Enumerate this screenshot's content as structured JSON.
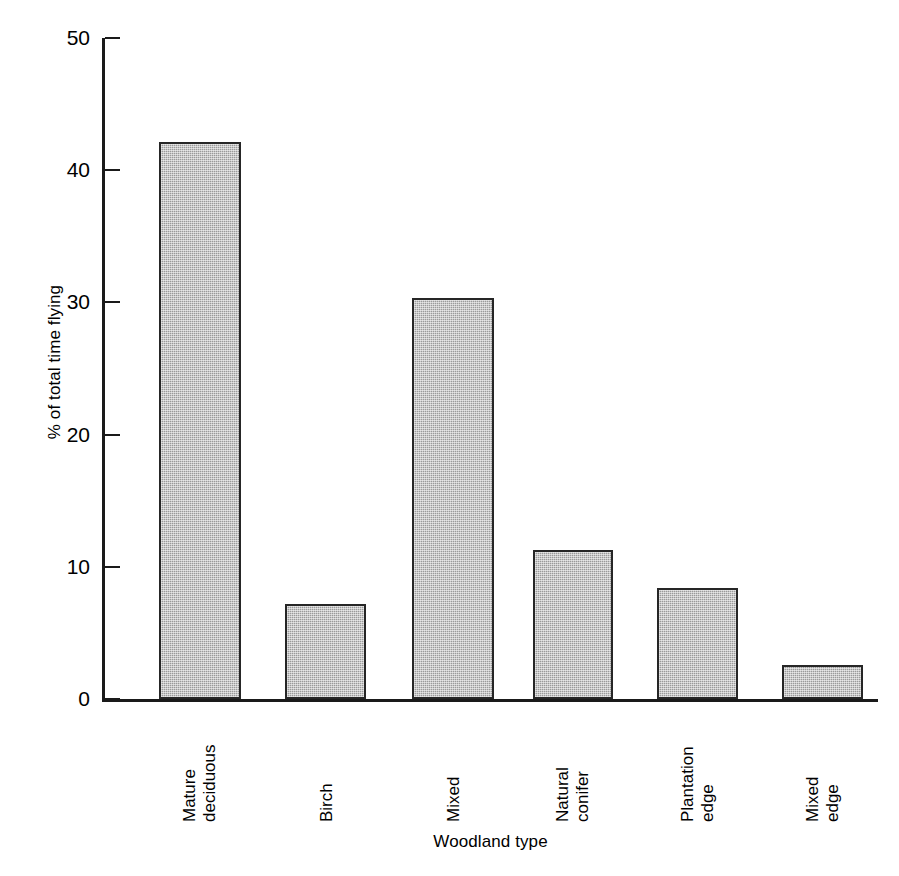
{
  "chart_data": {
    "type": "bar",
    "title": "",
    "xlabel": "Woodland type",
    "ylabel": "% of total time flying",
    "categories": [
      "Mature deciduous",
      "Birch",
      "Mixed",
      "Natural conifer",
      "Plantation edge",
      "Mixed edge"
    ],
    "category_lines": [
      [
        "Mature",
        "deciduous"
      ],
      [
        "Birch",
        ""
      ],
      [
        "Mixed",
        ""
      ],
      [
        "Natural",
        "conifer"
      ],
      [
        "Plantation",
        "edge"
      ],
      [
        "Mixed",
        "edge"
      ]
    ],
    "values": [
      42.1,
      7.2,
      30.3,
      11.3,
      8.4,
      2.6
    ],
    "ylim": [
      0,
      50
    ],
    "yticks": [
      0,
      10,
      20,
      30,
      40,
      50
    ],
    "ytick_labels": [
      "0",
      "10",
      "20",
      "30",
      "40",
      "50"
    ],
    "grid": false,
    "legend": "none",
    "bar_fill_color": "#9a9a9a",
    "bar_edge_color": "#262626",
    "axis_color": "#1a1a1a",
    "background_color": "#ffffff"
  }
}
